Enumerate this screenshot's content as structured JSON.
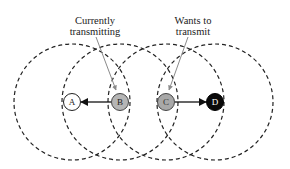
{
  "diagram": {
    "type": "wireless-hidden-exposed-terminal",
    "nodes": [
      {
        "id": "A",
        "label": "A",
        "cx": 72,
        "cy": 102,
        "fill": "#ffffff",
        "text_color": "#222222",
        "role": "receiver"
      },
      {
        "id": "B",
        "label": "B",
        "cx": 120,
        "cy": 102,
        "fill": "#b5b5b5",
        "text_color": "#222222",
        "role": "currently transmitting"
      },
      {
        "id": "C",
        "label": "C",
        "cx": 166,
        "cy": 102,
        "fill": "#a8a8a8",
        "text_color": "#333333",
        "role": "wants to transmit"
      },
      {
        "id": "D",
        "label": "D",
        "cx": 215,
        "cy": 102,
        "fill": "#0a0a0a",
        "text_color": "#ffffff",
        "role": "receiver"
      }
    ],
    "range_circles": [
      {
        "center": "A",
        "cx": 72,
        "cy": 102,
        "r": 58
      },
      {
        "center": "B",
        "cx": 120,
        "cy": 102,
        "r": 58
      },
      {
        "center": "C",
        "cx": 166,
        "cy": 102,
        "r": 58
      },
      {
        "center": "D",
        "cx": 215,
        "cy": 102,
        "r": 58
      }
    ],
    "edges": [
      {
        "from": "B",
        "to": "A"
      },
      {
        "from": "C",
        "to": "D"
      }
    ],
    "annotations": [
      {
        "line1": "Currently",
        "line2": "transmitting",
        "x": 95,
        "target": "B"
      },
      {
        "line1": "Wants to",
        "line2": "transmit",
        "x": 193,
        "target": "C"
      }
    ],
    "colors": {
      "circle_stroke": "#222222",
      "edge": "#111111",
      "annotation_line": "#8a8a8a"
    }
  }
}
